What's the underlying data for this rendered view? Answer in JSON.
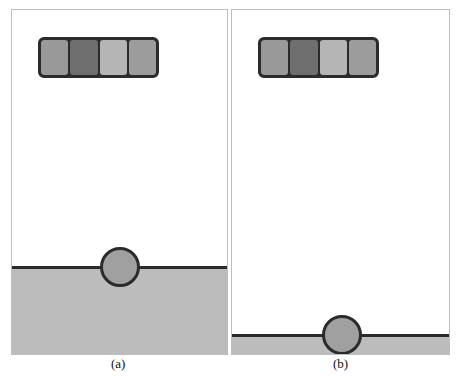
{
  "figure": {
    "panels": [
      {
        "id": "a",
        "caption": "(a)",
        "bar_segment_colors": [
          "#999999",
          "#6e6e6e",
          "#b5b5b5",
          "#9c9c9c"
        ],
        "ground_color": "#bcbcbc",
        "ball_color": "#a0a0a0"
      },
      {
        "id": "b",
        "caption": "(b)",
        "bar_segment_colors": [
          "#999999",
          "#6e6e6e",
          "#b5b5b5",
          "#9c9c9c"
        ],
        "ground_color": "#bcbcbc",
        "ball_color": "#a0a0a0"
      }
    ],
    "outline_color": "#2b2b2b"
  }
}
